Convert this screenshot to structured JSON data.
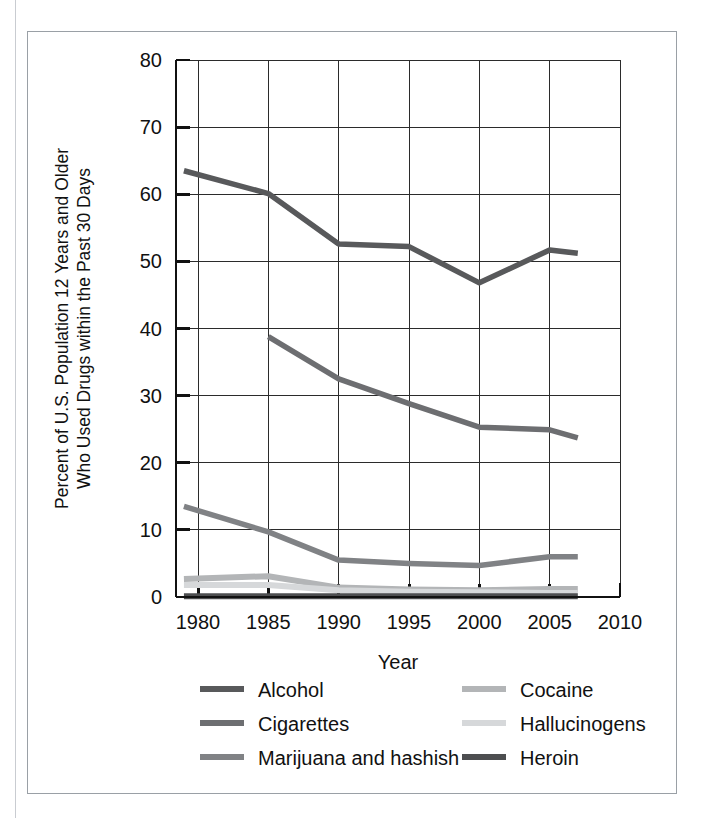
{
  "chart_data": {
    "type": "line",
    "title": "",
    "xlabel": "Year",
    "ylabel": "Percent of U.S. Population 12 Years and Older Who Used Drugs within the Past 30 Days",
    "ylabel_line1": "Percent of U.S. Population 12 Years and Older",
    "ylabel_line2": "Who Used Drugs within the Past 30 Days",
    "xlim": [
      1979,
      2010
    ],
    "ylim": [
      0,
      80
    ],
    "xticks": [
      1980,
      1985,
      1990,
      1995,
      2000,
      2005,
      2010
    ],
    "yticks": [
      0,
      10,
      20,
      30,
      40,
      50,
      60,
      70,
      80
    ],
    "xtick_labels": [
      "1980",
      "1985",
      "1990",
      "1995",
      "2000",
      "2005",
      "2010"
    ],
    "ytick_labels": [
      "0",
      "10",
      "20",
      "30",
      "40",
      "50",
      "60",
      "70",
      "80"
    ],
    "grid": true,
    "legend_position": "bottom",
    "series": [
      {
        "name": "Alcohol",
        "color": "#58595b",
        "width": 5.5,
        "x": [
          1979,
          1985,
          1990,
          1995,
          2000,
          2005,
          2007
        ],
        "values": [
          63.5,
          60.1,
          52.6,
          52.2,
          46.8,
          51.7,
          51.2
        ]
      },
      {
        "name": "Cigarettes",
        "color": "#6d6e71",
        "width": 5.5,
        "x": [
          1985,
          1990,
          1995,
          2000,
          2005,
          2007
        ],
        "values": [
          38.8,
          32.5,
          28.8,
          25.3,
          24.9,
          23.7
        ]
      },
      {
        "name": "Marijuana and hashish",
        "color": "#808285",
        "width": 5.5,
        "x": [
          1979,
          1985,
          1990,
          1995,
          2000,
          2005,
          2007
        ],
        "values": [
          13.5,
          9.7,
          5.5,
          5.0,
          4.7,
          6.0,
          6.0
        ]
      },
      {
        "name": "Cocaine",
        "color": "#b3b5b7",
        "width": 6.0,
        "x": [
          1979,
          1985,
          1990,
          1995,
          2000,
          2005,
          2007
        ],
        "values": [
          2.7,
          3.1,
          1.4,
          1.1,
          1.0,
          1.2,
          1.2
        ]
      },
      {
        "name": "Hallucinogens",
        "color": "#d6d8da",
        "width": 6.0,
        "x": [
          1979,
          1985,
          1990,
          1995,
          2000,
          2005,
          2007
        ],
        "values": [
          1.8,
          1.8,
          1.0,
          0.8,
          0.7,
          0.6,
          0.6
        ]
      },
      {
        "name": "Heroin",
        "color": "#4d4e50",
        "width": 6.0,
        "x": [
          1979,
          1985,
          1990,
          1995,
          2000,
          2005,
          2007
        ],
        "values": [
          0.1,
          0.1,
          0.1,
          0.1,
          0.1,
          0.1,
          0.1
        ]
      }
    ],
    "legend": [
      {
        "label": "Alcohol",
        "color": "#58595b",
        "column": 0,
        "row": 0
      },
      {
        "label": "Cigarettes",
        "color": "#6d6e71",
        "column": 0,
        "row": 1
      },
      {
        "label": "Marijuana and hashish",
        "color": "#808285",
        "column": 0,
        "row": 2
      },
      {
        "label": "Cocaine",
        "color": "#b3b5b7",
        "column": 1,
        "row": 0
      },
      {
        "label": "Hallucinogens",
        "color": "#d6d8da",
        "column": 1,
        "row": 1
      },
      {
        "label": "Heroin",
        "color": "#4d4e50",
        "column": 1,
        "row": 2
      }
    ]
  },
  "figure": {
    "border_color": "#9aa0a6",
    "background": "#ffffff",
    "axis_color": "#111111",
    "grid_color": "#2b2b2b"
  }
}
